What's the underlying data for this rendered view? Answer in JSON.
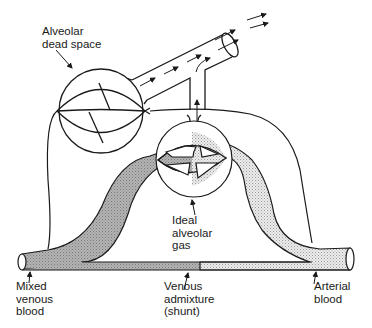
{
  "diagram": {
    "type": "physiology schematic",
    "labels": {
      "dead_space": [
        "Alveolar",
        "dead space"
      ],
      "ideal": [
        "Ideal",
        "alveolar",
        "gas"
      ],
      "mixed_venous": [
        "Mixed",
        "venous",
        "blood"
      ],
      "shunt": [
        "Venous",
        "admixture",
        "(shunt)"
      ],
      "arterial": [
        "Arterial",
        "blood"
      ]
    },
    "colors": {
      "line": "#1a1a1a",
      "venous_fill": "#a8a8a8",
      "arterial_fill": "#d6d6d6",
      "background": "#ffffff"
    }
  }
}
